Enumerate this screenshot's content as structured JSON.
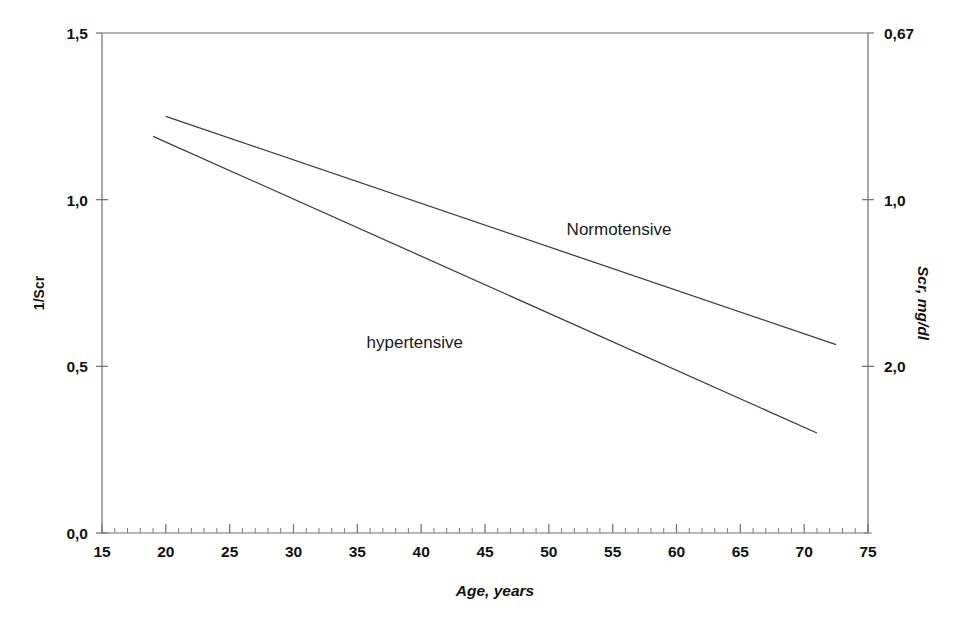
{
  "chart_data": {
    "type": "line",
    "title": "",
    "subtitle": "",
    "xlabel": "Age,  years",
    "ylabel": "1/Scr",
    "ylabel_right": "Scr, mg/dl",
    "xlim": [
      15,
      75
    ],
    "ylim": [
      0.0,
      1.5
    ],
    "grid": false,
    "legend_position": "inline-annotations",
    "x_ticks": [
      15,
      20,
      25,
      30,
      35,
      40,
      45,
      50,
      55,
      60,
      65,
      70,
      75
    ],
    "x_tick_labels": [
      "15",
      "20",
      "25",
      "30",
      "35",
      "40",
      "45",
      "50",
      "55",
      "60",
      "65",
      "70",
      "75"
    ],
    "x_minor_tick_step": 1,
    "y_ticks": [
      0.0,
      0.5,
      1.0,
      1.5
    ],
    "y_tick_labels": [
      "0,0",
      "0,5",
      "1,0",
      "1,5"
    ],
    "y_right_ticks": [
      1.5,
      1.0,
      0.5
    ],
    "y_right_tick_labels": [
      "0,67",
      "1,0",
      "2,0"
    ],
    "series": [
      {
        "name": "Normotensive",
        "label": "Normotensive",
        "label_x": 55.5,
        "label_y": 0.895,
        "color": "#3b3b3b",
        "x": [
          20,
          72.5
        ],
        "values": [
          1.25,
          0.565
        ]
      },
      {
        "name": "hypertensive",
        "label": "hypertensive",
        "label_x": 39.5,
        "label_y": 0.555,
        "color": "#3b3b3b",
        "x": [
          19,
          71
        ],
        "values": [
          1.19,
          0.3
        ]
      }
    ],
    "annotations": [
      {
        "text": "Normotensive",
        "x": 55.5,
        "y": 0.895
      },
      {
        "text": "hypertensive",
        "x": 39.5,
        "y": 0.555
      }
    ],
    "colors": {
      "axis": "#6e6e6e",
      "line": "#3b3b3b",
      "text": "#111111",
      "background": "#ffffff"
    }
  }
}
